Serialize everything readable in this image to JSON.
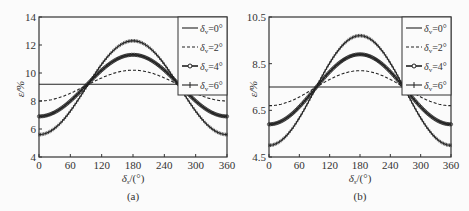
{
  "chart_data": [
    {
      "type": "line",
      "panel": "(a)",
      "caption": "(a)",
      "xlabel": "δs/(°)",
      "ylabel": "ε/%",
      "xlim": [
        0,
        360
      ],
      "ylim": [
        4,
        14
      ],
      "xticks": [
        0,
        60,
        120,
        180,
        240,
        300,
        360
      ],
      "yticks": [
        4,
        6,
        8,
        10,
        12,
        14
      ],
      "grid": false,
      "legend_position": "upper right",
      "series": [
        {
          "name": "δv=0°",
          "style": "solid",
          "mean": 9.2,
          "amplitude": 0.0
        },
        {
          "name": "δv=2°",
          "style": "dashed",
          "mean": 9.1,
          "amplitude": 1.1,
          "min_at_0": 8.0,
          "max_at_180": 10.2
        },
        {
          "name": "δv=4°",
          "style": "circle-marker",
          "mean": 9.1,
          "amplitude": 2.2,
          "min_at_0": 6.9,
          "max_at_180": 11.3
        },
        {
          "name": "δv=6°",
          "style": "plus-marker",
          "mean": 8.95,
          "amplitude": 3.35,
          "min_at_0": 5.6,
          "max_at_180": 12.3
        }
      ]
    },
    {
      "type": "line",
      "panel": "(b)",
      "caption": "(b)",
      "xlabel": "δs/(°)",
      "ylabel": "ε/%",
      "xlim": [
        0,
        360
      ],
      "ylim": [
        4.5,
        10.5
      ],
      "xticks": [
        0,
        60,
        120,
        180,
        240,
        300,
        360
      ],
      "yticks": [
        4.5,
        6.5,
        8.5,
        10.5
      ],
      "grid": false,
      "legend_position": "upper right",
      "series": [
        {
          "name": "δv=0°",
          "style": "solid",
          "mean": 7.5,
          "amplitude": 0.0
        },
        {
          "name": "δv=2°",
          "style": "dashed",
          "mean": 7.45,
          "amplitude": 0.75,
          "min_at_0": 6.7,
          "max_at_180": 8.2
        },
        {
          "name": "δv=4°",
          "style": "circle-marker",
          "mean": 7.4,
          "amplitude": 1.5,
          "min_at_0": 5.9,
          "max_at_180": 8.9
        },
        {
          "name": "δv=6°",
          "style": "plus-marker",
          "mean": 7.35,
          "amplitude": 2.35,
          "min_at_0": 5.0,
          "max_at_180": 9.7
        }
      ]
    }
  ],
  "legend": {
    "items": [
      {
        "sym": "δ",
        "sub": "v",
        "rest": "=0°"
      },
      {
        "sym": "δ",
        "sub": "v",
        "rest": "=2°"
      },
      {
        "sym": "δ",
        "sub": "v",
        "rest": "=4°"
      },
      {
        "sym": "δ",
        "sub": "v",
        "rest": "=6°"
      }
    ]
  },
  "labels": {
    "x_sym": "δ",
    "x_sub": "s",
    "x_unit": "/(°)",
    "y_label": "ε/%",
    "cap_a": "(a)",
    "cap_b": "(b)"
  }
}
